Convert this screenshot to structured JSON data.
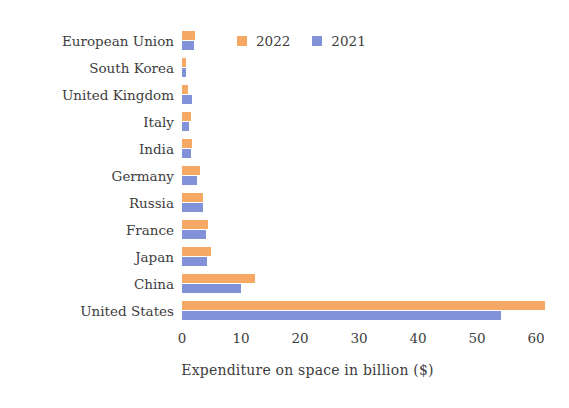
{
  "chart_data": {
    "type": "bar",
    "orientation": "horizontal",
    "title": "",
    "xlabel": "Expenditure on space in billion ($)",
    "ylabel": "",
    "xlim": [
      0,
      62
    ],
    "xticks": [
      0,
      10,
      20,
      30,
      40,
      50,
      60
    ],
    "xtick_labels": [
      "0",
      "10",
      "20",
      "30",
      "40",
      "50",
      "60"
    ],
    "grid": false,
    "legend_position": "top-center",
    "categories": [
      "European Union",
      "South Korea",
      "United Kingdom",
      "Italy",
      "India",
      "Germany",
      "Russia",
      "France",
      "Japan",
      "China",
      "United States"
    ],
    "series": [
      {
        "name": "2022",
        "color": "#f5a965",
        "values": [
          2.2,
          0.7,
          1.0,
          1.6,
          1.7,
          3.1,
          3.6,
          4.4,
          4.9,
          12.4,
          61.5
        ]
      },
      {
        "name": "2021",
        "color": "#8192d8",
        "values": [
          2.0,
          0.6,
          1.7,
          1.2,
          1.5,
          2.6,
          3.5,
          4.1,
          4.2,
          10.0,
          54.0
        ]
      }
    ]
  },
  "legend": {
    "items": [
      {
        "label": "2022",
        "color": "#f5a965"
      },
      {
        "label": "2021",
        "color": "#8192d8"
      }
    ]
  },
  "axis": {
    "x_title": "Expenditure on space in billion ($)"
  }
}
